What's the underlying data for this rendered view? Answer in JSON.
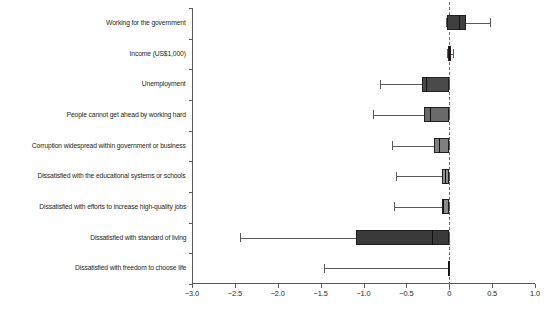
{
  "chart_data": {
    "type": "box",
    "title": "",
    "xlabel": "",
    "ylabel": "",
    "xlim": [
      -3.0,
      1.0
    ],
    "grid": false,
    "legend": "none",
    "zero_reference_line": 0,
    "xticks": [
      -3.0,
      -2.5,
      -2.0,
      -1.5,
      -1.0,
      -0.5,
      0,
      0.5,
      1.0
    ],
    "xticklabels": [
      "−3.0",
      "−2.5",
      "−2.0",
      "−1.5",
      "−1.0",
      "−0.5",
      "0",
      "0.5",
      "1.0"
    ],
    "categories": [
      "Working for the government",
      "Income (US$1,000)",
      "Unemployment",
      "People cannot get ahead by working hard",
      "Corruption widespread within government or business",
      "Dissatisfied with the educational systems or schools",
      "Dissatisfied with efforts to increase high-quality jobs",
      "Dissatisfied with standard of living",
      "Dissatisfied with freedom to choose life"
    ],
    "boxes": [
      {
        "category": "Working for the government",
        "whisker_low": -0.04,
        "q1": -0.03,
        "median": 0.11,
        "q3": 0.19,
        "whisker_high": 0.48,
        "color": "#3f3f3f"
      },
      {
        "category": "Income (US$1,000)",
        "whisker_low": -0.03,
        "q1": -0.02,
        "median": 0.0,
        "q3": 0.02,
        "whisker_high": 0.04,
        "color": "#3f3f3f"
      },
      {
        "category": "Unemployment",
        "whisker_low": -0.81,
        "q1": -0.32,
        "median": -0.27,
        "q3": 0.0,
        "whisker_high": 0.0,
        "color": "#4a4a4a"
      },
      {
        "category": "People cannot get ahead by working hard",
        "whisker_low": -0.89,
        "q1": -0.29,
        "median": -0.22,
        "q3": 0.0,
        "whisker_high": 0.0,
        "color": "#6a6a6a"
      },
      {
        "category": "Corruption widespread within government or business",
        "whisker_low": -0.67,
        "q1": -0.18,
        "median": -0.12,
        "q3": 0.0,
        "whisker_high": 0.0,
        "color": "#808080"
      },
      {
        "category": "Dissatisfied with the educational systems or schools",
        "whisker_low": -0.62,
        "q1": -0.08,
        "median": -0.05,
        "q3": 0.0,
        "whisker_high": 0.0,
        "color": "#909090"
      },
      {
        "category": "Dissatisfied with efforts to increase high-quality jobs",
        "whisker_low": -0.64,
        "q1": -0.09,
        "median": -0.07,
        "q3": 0.0,
        "whisker_high": 0.0,
        "color": "#8a8a8a"
      },
      {
        "category": "Dissatisfied with standard of living",
        "whisker_low": -2.44,
        "q1": -1.09,
        "median": -0.2,
        "q3": 0.0,
        "whisker_high": 0.0,
        "color": "#3a3a3a"
      },
      {
        "category": "Dissatisfied with freedom to choose life",
        "whisker_low": -1.46,
        "q1": -0.02,
        "median": -0.01,
        "q3": 0.0,
        "whisker_high": 0.0,
        "color": "#4a4a4a"
      }
    ]
  },
  "axis": {
    "x_min_label": "−3.0",
    "x_max_label": "1.0"
  }
}
